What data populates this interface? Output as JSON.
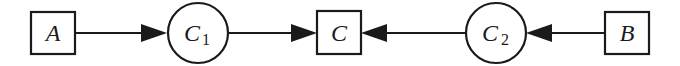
{
  "diagram": {
    "type": "flow-diagram",
    "stroke_color": "#1a1a1a",
    "background": "#ffffff",
    "nodes": [
      {
        "id": "A",
        "shape": "square",
        "label": "A",
        "subscript": ""
      },
      {
        "id": "C1",
        "shape": "circle",
        "label": "C",
        "subscript": "1"
      },
      {
        "id": "C",
        "shape": "square",
        "label": "C",
        "subscript": ""
      },
      {
        "id": "C2",
        "shape": "circle",
        "label": "C",
        "subscript": "2"
      },
      {
        "id": "B",
        "shape": "square",
        "label": "B",
        "subscript": ""
      }
    ],
    "edges": [
      {
        "from": "A",
        "to": "C1"
      },
      {
        "from": "C1",
        "to": "C"
      },
      {
        "from": "C2",
        "to": "C"
      },
      {
        "from": "B",
        "to": "C2"
      }
    ]
  }
}
